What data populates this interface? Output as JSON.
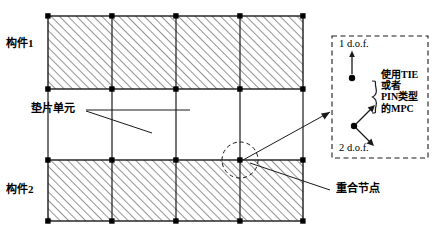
{
  "diagram": {
    "background_color": "#ffffff",
    "line_color": "#1a1a1a",
    "hatch_color": "#3a3a3a",
    "labels": {
      "component_1": "构件1",
      "component_2": "构件2",
      "gasket_element": "垫片单元",
      "coincident_nodes": "重合节点",
      "dof_top": "1 d.o.f.",
      "dof_bottom": "2 d.o.f.",
      "mpc_line_1": "使用TIE",
      "mpc_line_2": "或者",
      "mpc_line_3": "PIN类型",
      "mpc_line_4": "的MPC"
    },
    "mesh": {
      "columns": 4,
      "upper_block_rows": 1,
      "lower_block_rows": 1,
      "hatch_pattern": "diagonal-45",
      "node_marker": "filled-square"
    },
    "detail_box": {
      "border_style": "dashed",
      "node_count": 2,
      "brace": "right-curly-brace"
    }
  }
}
